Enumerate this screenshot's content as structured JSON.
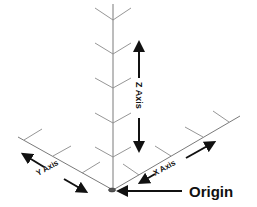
{
  "diagram": {
    "type": "3d-coordinate-axes",
    "labels": {
      "z_axis": "Z Axis",
      "x_axis": "X Axis",
      "y_axis": "Y Axis",
      "origin": "Origin"
    },
    "colors": {
      "grid": "#8a8a8a",
      "arrows": "#111111",
      "text": "#111111",
      "background": "#ffffff"
    }
  }
}
